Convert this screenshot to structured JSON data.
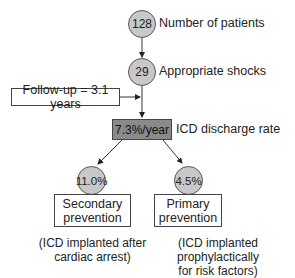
{
  "diagram": {
    "nodes": {
      "patients": {
        "value": "128",
        "label": "Number of patients"
      },
      "shocks": {
        "value": "29",
        "label": "Appropriate shocks"
      },
      "followup": {
        "label": "Follow-up = 3.1 years"
      },
      "discharge": {
        "value": "7.3%/year",
        "label": "ICD discharge rate"
      },
      "secondary": {
        "value": "11.0%",
        "title_line1": "Secondary",
        "title_line2": "prevention",
        "note_line1": "(ICD implanted after",
        "note_line2": "cardiac arrest)"
      },
      "primary": {
        "value": "4.5%",
        "title_line1": "Primary",
        "title_line2": "prevention",
        "note_line1": "(ICD implanted prophylactically",
        "note_line2": "for risk factors)"
      }
    },
    "colors": {
      "circle_fill": "#c8c8c8",
      "dark_box_fill": "#8a8a8a",
      "stroke": "#444444"
    }
  }
}
